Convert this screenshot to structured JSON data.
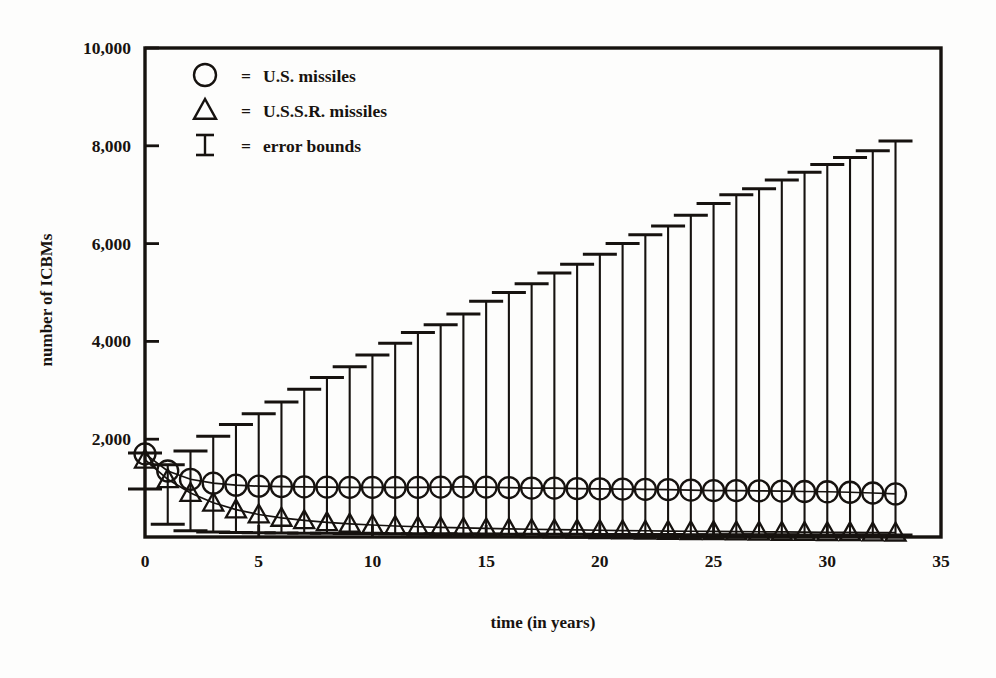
{
  "figure": {
    "background_color": "#fdfdfc",
    "ink_color": "#16120f"
  },
  "chart_data": {
    "type": "line",
    "title": "",
    "subtitle": "",
    "xlabel": "time (in years)",
    "ylabel": "number of ICBMs",
    "xlim": [
      0,
      35
    ],
    "ylim": [
      0,
      10000
    ],
    "xticks": [
      0,
      5,
      10,
      15,
      20,
      25,
      30,
      35
    ],
    "xticklabels": [
      "0",
      "5",
      "10",
      "15",
      "20",
      "25",
      "30",
      "35"
    ],
    "yticks": [
      0,
      2000,
      4000,
      6000,
      8000,
      10000
    ],
    "yticklabels": [
      "0",
      "2,000",
      "4,000",
      "6,000",
      "8,000",
      "10,000"
    ],
    "grid": false,
    "frame": "box",
    "legend": {
      "position": "top-left-inside",
      "entries": [
        {
          "marker": "circle-open",
          "separator": "=",
          "label": "U.S. missiles"
        },
        {
          "marker": "triangle-open",
          "separator": "=",
          "label": "U.S.S.R. missiles"
        },
        {
          "marker": "error-bar-ibeam",
          "separator": "=",
          "label": "error bounds"
        }
      ]
    },
    "x": [
      0,
      1,
      2,
      3,
      4,
      5,
      6,
      7,
      8,
      9,
      10,
      11,
      12,
      13,
      14,
      15,
      16,
      17,
      18,
      19,
      20,
      21,
      22,
      23,
      24,
      25,
      26,
      27,
      28,
      29,
      30,
      31,
      32,
      33
    ],
    "series": [
      {
        "name": "U.S. missiles",
        "marker": "circle-open",
        "values": [
          1700,
          1350,
          1180,
          1100,
          1060,
          1040,
          1030,
          1025,
          1020,
          1015,
          1015,
          1015,
          1015,
          1020,
          1025,
          1020,
          1010,
          1000,
          1000,
          990,
          985,
          980,
          975,
          970,
          960,
          950,
          950,
          945,
          940,
          930,
          925,
          915,
          900,
          880
        ]
      },
      {
        "name": "U.S.S.R. missiles",
        "marker": "triangle-open",
        "values": [
          1580,
          1180,
          900,
          700,
          560,
          460,
          390,
          340,
          300,
          270,
          245,
          225,
          210,
          195,
          185,
          175,
          165,
          158,
          150,
          145,
          138,
          132,
          128,
          122,
          118,
          115,
          110,
          107,
          103,
          100,
          97,
          94,
          90,
          88
        ]
      }
    ],
    "error_bounds": {
      "name": "error bounds",
      "lower": [
        980,
        260,
        130,
        100,
        90,
        85,
        80,
        78,
        75,
        72,
        70,
        68,
        66,
        64,
        62,
        60,
        58,
        56,
        55,
        54,
        52,
        51,
        50,
        49,
        48,
        47,
        46,
        45,
        44,
        43,
        42,
        41,
        40,
        40
      ],
      "upper": [
        1720,
        1480,
        1760,
        2060,
        2300,
        2520,
        2760,
        3020,
        3260,
        3480,
        3720,
        3960,
        4180,
        4340,
        4560,
        4820,
        5000,
        5180,
        5400,
        5580,
        5780,
        6000,
        6180,
        6360,
        6580,
        6820,
        7000,
        7120,
        7300,
        7460,
        7620,
        7760,
        7900,
        8100
      ]
    }
  }
}
